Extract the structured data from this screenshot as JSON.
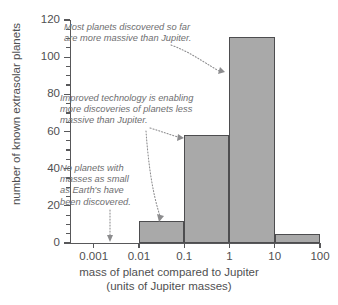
{
  "chart_data": {
    "type": "bar",
    "title": "",
    "xlabel": "mass of planet compared to Jupiter (units of Jupiter masses)",
    "ylabel": "number of known extrasolar planets",
    "xscale": "log",
    "xlim": [
      0.0003,
      100
    ],
    "ylim": [
      0,
      120
    ],
    "grid": false,
    "legend": null,
    "x_tick_labels": [
      "0.001",
      "0.01",
      "0.1",
      "1",
      "10",
      "100"
    ],
    "x_tick_values": [
      0.001,
      0.01,
      0.1,
      1,
      10,
      100
    ],
    "y_tick_labels": [
      "0",
      "20",
      "40",
      "60",
      "80",
      "100",
      "120"
    ],
    "y_tick_values": [
      0,
      20,
      40,
      60,
      80,
      100,
      120
    ],
    "y_minor_tick_step": 5,
    "bar_color": "#a9a9a9",
    "bar_edge_color": "#4d4d4f",
    "bins": [
      {
        "range_label": "0.001-0.01",
        "x_low": 0.001,
        "x_high": 0.01,
        "value": 0
      },
      {
        "range_label": "0.01-0.1",
        "x_low": 0.01,
        "x_high": 0.1,
        "value": 12
      },
      {
        "range_label": "0.1-1",
        "x_low": 0.1,
        "x_high": 1,
        "value": 58
      },
      {
        "range_label": "1-10",
        "x_low": 1,
        "x_high": 10,
        "value": 111
      },
      {
        "range_label": "10-100",
        "x_low": 10,
        "x_high": 100,
        "value": 5
      }
    ],
    "categories": [
      "0.001-0.01",
      "0.01-0.1",
      "0.1-1",
      "1-10",
      "10-100"
    ],
    "values": [
      0,
      12,
      58,
      111,
      5
    ],
    "annotations": [
      {
        "id": "note1",
        "text": "Most planets discovered so far\nare more massive than Jupiter.",
        "points_to": "1-10 bar"
      },
      {
        "id": "note2",
        "text": "Improved technology is enabling\nmore discoveries of planets less\nmassive than Jupiter.",
        "points_to": "0.1-1 bar and 0.01-0.1 bar"
      },
      {
        "id": "note3",
        "text": "No planets with\nmasses as small\nas Earth's have\nbeen discovered.",
        "points_to": "empty 0.001-0.01 region"
      }
    ]
  },
  "axes": {
    "x_title_line1": "mass of planet compared to Jupiter",
    "x_title_line2": "(units of Jupiter masses)",
    "y_title": "number of known extrasolar planets"
  },
  "notes": {
    "note1": "Most planets discovered so far\nare more massive than Jupiter.",
    "note2": "Improved technology is enabling\nmore discoveries of planets less\nmassive than Jupiter.",
    "note3": "No planets with\nmasses as small\nas Earth's have\nbeen discovered."
  },
  "ticks": {
    "y": [
      "120",
      "100",
      "80",
      "60",
      "40",
      "20",
      "0"
    ],
    "x": [
      "0.001",
      "0.01",
      "0.1",
      "1",
      "10",
      "100"
    ]
  }
}
